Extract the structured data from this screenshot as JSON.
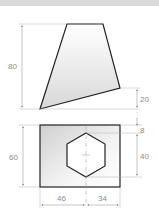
{
  "drawing": {
    "type": "orthographic-projection",
    "views": [
      {
        "name": "top-view",
        "shape": "quadrilateral",
        "points": [
          [
            67,
            24
          ],
          [
            103,
            24
          ],
          [
            120,
            88
          ],
          [
            40,
            109
          ]
        ],
        "fill_gradient": [
          "#ffffff",
          "#d8d8d8"
        ]
      },
      {
        "name": "front-view",
        "shape": "rectangle",
        "rect": {
          "x": 40,
          "y": 125,
          "width": 80,
          "height": 62
        },
        "fill_gradient": [
          "#d0d0d0",
          "#ffffff"
        ],
        "hexagon_hole": {
          "center": [
            86,
            155
          ],
          "points": [
            [
              86,
              133
            ],
            [
              105,
              144
            ],
            [
              105,
              166
            ],
            [
              86,
              177
            ],
            [
              67,
              166
            ],
            [
              67,
              144
            ]
          ]
        }
      }
    ],
    "dimensions": {
      "height_top": "80",
      "offset_20": "20",
      "offset_8": "8",
      "hex_height_40": "40",
      "height_front": "60",
      "width_left": "46",
      "width_right": "34"
    },
    "colors": {
      "outline": "#222222",
      "dimension_line": "#a0a0a0",
      "dimension_text": "#8a8a8a",
      "top_band": "#d9d9d9"
    }
  }
}
